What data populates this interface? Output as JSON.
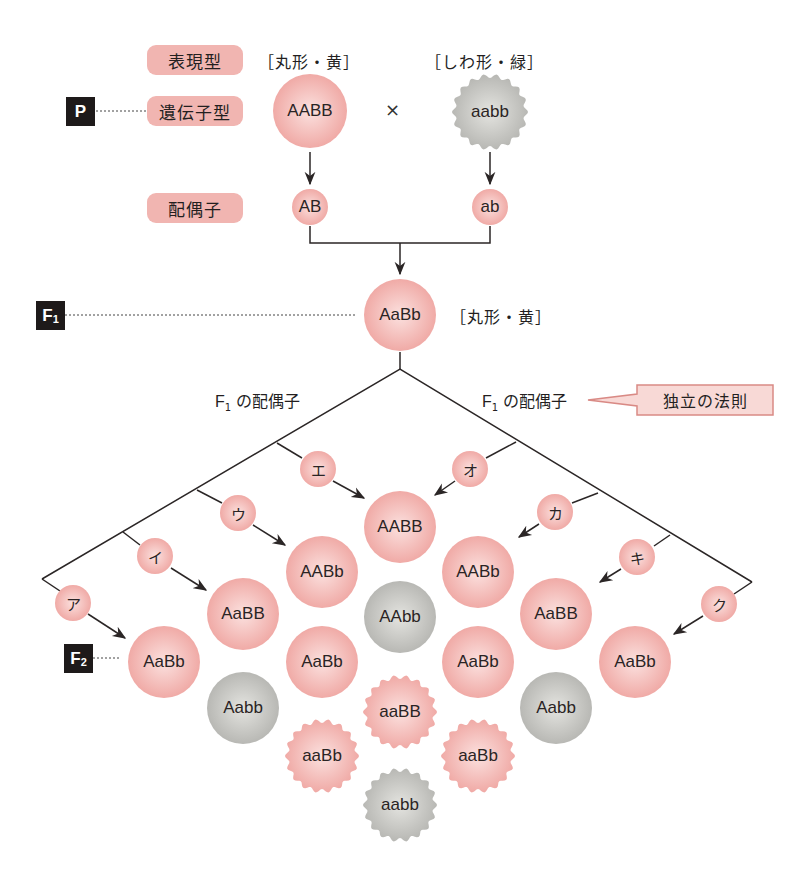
{
  "colors": {
    "dominant_fill": "#f2b3af",
    "dominant_center": "#fbe1df",
    "recessive_fill": "#c4c4c0",
    "recessive_center": "#e6e6e2",
    "label_pill": "#f1b5b1",
    "generation_box": "#1e1a1a",
    "line": "#2b2626",
    "callout_fill": "#f8d9d6",
    "callout_stroke": "#d98a85"
  },
  "row_labels": {
    "phenotype": "表現型",
    "genotype": "遺伝子型",
    "gamete": "配偶子"
  },
  "generations": {
    "p": {
      "letter": "P",
      "sub": ""
    },
    "f1": {
      "letter": "F",
      "sub": "1"
    },
    "f2": {
      "letter": "F",
      "sub": "2"
    }
  },
  "parents": {
    "left": {
      "phenotype": "［丸形・黄］",
      "genotype": "AABB",
      "gamete": "AB",
      "shape": "round",
      "color": "pink"
    },
    "cross_symbol": "×",
    "right": {
      "phenotype": "［しわ形・緑］",
      "genotype": "aabb",
      "gamete": "ab",
      "shape": "wrinkled",
      "color": "gray"
    }
  },
  "f1": {
    "genotype": "AaBb",
    "phenotype": "［丸形・黄］"
  },
  "gamete_labels": {
    "left": {
      "prefix": "F",
      "sub": "1",
      "text": " の配偶子"
    },
    "right": {
      "prefix": "F",
      "sub": "1",
      "text": " の配偶子"
    }
  },
  "callout": {
    "text": "独立の法則"
  },
  "gamete_blanks": {
    "left": [
      "ア",
      "イ",
      "ウ",
      "エ"
    ],
    "right": [
      "オ",
      "カ",
      "キ",
      "ク"
    ]
  },
  "f2_nodes": [
    {
      "genotype": "AABB",
      "x": 400,
      "y": 527,
      "shape": "round",
      "color": "pink"
    },
    {
      "genotype": "AABb",
      "x": 322,
      "y": 572,
      "shape": "round",
      "color": "pink"
    },
    {
      "genotype": "AABb",
      "x": 478,
      "y": 572,
      "shape": "round",
      "color": "pink"
    },
    {
      "genotype": "AaBB",
      "x": 243,
      "y": 614,
      "shape": "round",
      "color": "pink"
    },
    {
      "genotype": "AAbb",
      "x": 400,
      "y": 617,
      "shape": "round",
      "color": "gray"
    },
    {
      "genotype": "AaBB",
      "x": 556,
      "y": 614,
      "shape": "round",
      "color": "pink"
    },
    {
      "genotype": "AaBb",
      "x": 164,
      "y": 662,
      "shape": "round",
      "color": "pink"
    },
    {
      "genotype": "AaBb",
      "x": 322,
      "y": 662,
      "shape": "round",
      "color": "pink"
    },
    {
      "genotype": "AaBb",
      "x": 478,
      "y": 662,
      "shape": "round",
      "color": "pink"
    },
    {
      "genotype": "AaBb",
      "x": 635,
      "y": 662,
      "shape": "round",
      "color": "pink"
    },
    {
      "genotype": "Aabb",
      "x": 243,
      "y": 708,
      "shape": "round",
      "color": "gray"
    },
    {
      "genotype": "aaBB",
      "x": 400,
      "y": 712,
      "shape": "wrinkled",
      "color": "pink"
    },
    {
      "genotype": "Aabb",
      "x": 556,
      "y": 708,
      "shape": "round",
      "color": "gray"
    },
    {
      "genotype": "aaBb",
      "x": 322,
      "y": 756,
      "shape": "wrinkled",
      "color": "pink"
    },
    {
      "genotype": "aaBb",
      "x": 478,
      "y": 756,
      "shape": "wrinkled",
      "color": "pink"
    },
    {
      "genotype": "aabb",
      "x": 400,
      "y": 805,
      "shape": "wrinkled",
      "color": "gray"
    }
  ]
}
